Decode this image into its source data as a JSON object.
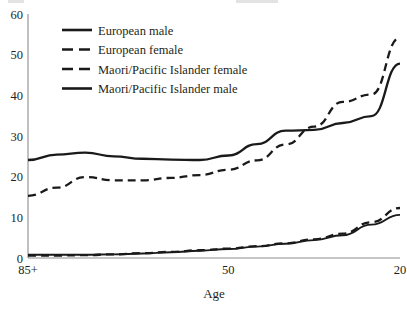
{
  "chart_data": {
    "type": "line",
    "title": "",
    "xlabel": "Age",
    "ylabel": "",
    "xtick_labels": [
      "85+",
      "50",
      "20"
    ],
    "xtick_values": [
      85,
      50,
      20
    ],
    "ytick_labels": [
      "0",
      "10",
      "20",
      "30",
      "40",
      "50",
      "60"
    ],
    "ytick_values": [
      0,
      10,
      20,
      30,
      40,
      50,
      60
    ],
    "ylim": [
      0,
      60
    ],
    "xlim_note": "x axis reversed: oldest (85+) at left, youngest (20) at right",
    "grid": false,
    "legend_position": "top-left inside plot",
    "x": [
      85,
      80,
      75,
      70,
      65,
      60,
      55,
      50,
      45,
      40,
      35,
      30,
      25,
      20
    ],
    "series": [
      {
        "name": "European male",
        "style": "solid",
        "color": "#1a1a1a",
        "values": [
          24.1,
          25.4,
          25.9,
          25.0,
          24.4,
          24.2,
          24.1,
          25.2,
          28.0,
          31.3,
          31.5,
          33.2,
          34.9,
          47.8
        ]
      },
      {
        "name": "European female",
        "style": "dashed",
        "color": "#1a1a1a",
        "values": [
          15.3,
          17.3,
          19.9,
          19.1,
          19.1,
          19.7,
          20.4,
          21.7,
          24.0,
          27.9,
          32.3,
          38.4,
          40.2,
          54.2
        ]
      },
      {
        "name": "Maori/Pacific Islander female",
        "style": "dashed",
        "color": "#1a1a1a",
        "values": [
          0.6,
          0.6,
          0.7,
          0.9,
          1.2,
          1.5,
          1.9,
          2.3,
          2.9,
          3.6,
          4.6,
          6.0,
          8.8,
          12.3
        ]
      },
      {
        "name": "Maori/Pacific Islander male",
        "style": "solid",
        "color": "#1a1a1a",
        "values": [
          0.8,
          0.8,
          0.8,
          0.9,
          1.1,
          1.4,
          1.8,
          2.2,
          2.8,
          3.5,
          4.4,
          5.6,
          8.2,
          10.6
        ]
      }
    ],
    "annotations": [
      "European female curve crosses above European male curve near age 45",
      "Maori/Pacific Islander female and male curves nearly overlap across all ages"
    ]
  },
  "legend": {
    "items": [
      {
        "label": "European male",
        "style": "solid"
      },
      {
        "label": "European female",
        "style": "dashed"
      },
      {
        "label": "Maori/Pacific Islander female",
        "style": "dashed"
      },
      {
        "label": "Maori/Pacific Islander male",
        "style": "solid"
      }
    ]
  },
  "axes": {
    "x_title": "Age",
    "x_ticks": [
      "85+",
      "50",
      "20"
    ],
    "y_ticks": [
      "60",
      "50",
      "40",
      "30",
      "20",
      "10",
      "0"
    ]
  }
}
